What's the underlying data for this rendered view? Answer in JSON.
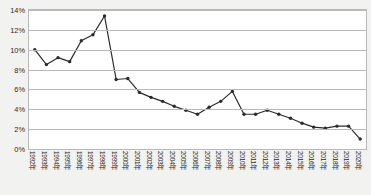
{
  "chart_data": {
    "type": "line",
    "title": "",
    "subtitle": "",
    "xlabel": "",
    "ylabel": "",
    "ylim": [
      0,
      14
    ],
    "ytick_values": [
      0,
      2,
      4,
      6,
      8,
      10,
      12,
      14
    ],
    "ytick_labels": [
      "0%",
      "2%",
      "4%",
      "6%",
      "8%",
      "10%",
      "12%",
      "14%"
    ],
    "grid": true,
    "legend": "none",
    "marker": "filled-circle",
    "line_color": "#2b2b2b",
    "plot_background": "#ffffff",
    "figure_background": "#f2f2f0",
    "grid_color": "#b9b9b9",
    "categories": [
      "1992年",
      "1993年",
      "1994年",
      "1995年",
      "1996年",
      "1997年",
      "1998年",
      "1999年",
      "2000年",
      "2001年",
      "2002年",
      "2003年",
      "2004年",
      "2005年",
      "2006年",
      "2007年",
      "2008年",
      "2009年",
      "2010年",
      "2011年",
      "2012年",
      "2013年",
      "2014年",
      "2015年",
      "2016年",
      "2017年",
      "2018年",
      "2019年",
      "2020年"
    ],
    "series": [
      {
        "name": "",
        "values": [
          10.0,
          8.5,
          9.2,
          8.8,
          10.9,
          11.5,
          13.4,
          7.0,
          7.1,
          5.7,
          5.2,
          4.8,
          4.3,
          3.9,
          3.5,
          4.2,
          4.8,
          5.8,
          3.5,
          3.5,
          3.9,
          3.5,
          3.1,
          2.6,
          2.2,
          2.1,
          2.3,
          2.3,
          1.0
        ]
      }
    ]
  },
  "axes": {
    "y_axis_name": "percent-axis",
    "x_axis_name": "year-axis"
  }
}
